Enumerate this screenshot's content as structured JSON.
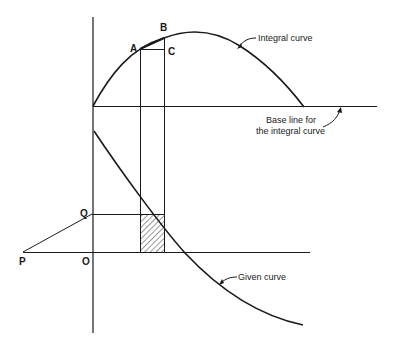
{
  "diagram": {
    "colors": {
      "background": "#ffffff",
      "ink": "#1a1a1a",
      "hatch": "#333333"
    },
    "points": {
      "A": "A",
      "B": "B",
      "C": "C",
      "P": "P",
      "Q": "Q",
      "O": "O"
    },
    "annotations": {
      "integral_curve": "Integral curve",
      "base_line_line1": "Base line for",
      "base_line_line2": "the integral curve",
      "given_curve": "Given curve"
    },
    "elements": [
      "vertical axis",
      "base line for the integral curve",
      "base line for the given curve (through P and O)",
      "integral curve (rises from origin to peak, descends to meet base line)",
      "given curve (descending, crosses lower base line)",
      "line PQ (pole to ordinate)",
      "horizontal line from Q to strip",
      "vertical strip lines through A and B",
      "hatched rectangle (strip area under given curve)",
      "chord AB with horizontal AC"
    ]
  }
}
